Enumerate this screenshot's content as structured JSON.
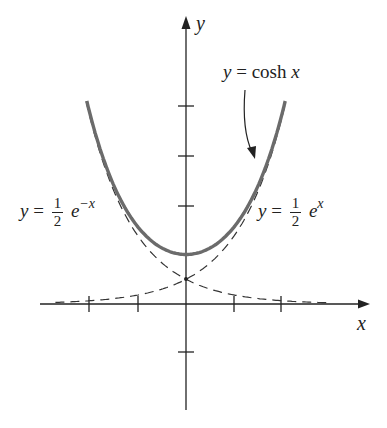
{
  "figure": {
    "axes": {
      "x_label": "x",
      "y_label": "y",
      "x_ticks": [
        -2,
        -1,
        1,
        2
      ],
      "y_ticks": [
        -1,
        1,
        2,
        3,
        4
      ],
      "origin_px": [
        186,
        304
      ],
      "unit_px_x": 47.5,
      "unit_px_y": 49.5
    },
    "curves": [
      {
        "name": "cosh",
        "expression": "y = cosh x",
        "style": "solid-thick",
        "color": "#6b6b6b"
      },
      {
        "name": "half-exp-neg",
        "expression": "y = 1/2 e^-x",
        "style": "dashed",
        "color": "#333333"
      },
      {
        "name": "half-exp-pos",
        "expression": "y = 1/2 e^x",
        "style": "dashed",
        "color": "#333333"
      }
    ],
    "labels": {
      "cosh": {
        "y": "y",
        "eq": "=",
        "fn": "cosh",
        "var": "x"
      },
      "left": {
        "y": "y",
        "eq": "=",
        "num": "1",
        "den": "2",
        "base": "e",
        "exp": "−x"
      },
      "right": {
        "y": "y",
        "eq": "=",
        "num": "1",
        "den": "2",
        "base": "e",
        "exp": "x"
      }
    }
  }
}
